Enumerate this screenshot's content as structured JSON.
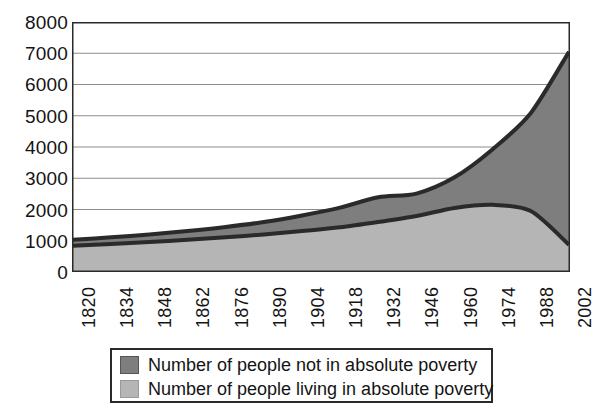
{
  "chart_data": {
    "type": "area",
    "title": "",
    "subtitle": "",
    "xlabel": "",
    "ylabel": "",
    "stacked": true,
    "grid": true,
    "legend_position": "bottom",
    "xlim": [
      1820,
      2002
    ],
    "ylim": [
      0,
      8000
    ],
    "x": [
      1820,
      1834,
      1848,
      1862,
      1876,
      1890,
      1904,
      1918,
      1932,
      1946,
      1960,
      1974,
      1988,
      2002
    ],
    "categories": [
      "1820",
      "1834",
      "1848",
      "1862",
      "1876",
      "1890",
      "1904",
      "1918",
      "1932",
      "1946",
      "1960",
      "1974",
      "1988",
      "2002"
    ],
    "ytick_labels": [
      "8000",
      "7000",
      "6000",
      "5000",
      "4000",
      "3000",
      "2000",
      "1000",
      "0"
    ],
    "ytick_values": [
      8000,
      7000,
      6000,
      5000,
      4000,
      3000,
      2000,
      1000,
      0
    ],
    "series": [
      {
        "name": "Number of people living in absolute poverty",
        "color": "#b5b5b5",
        "values": [
          840,
          900,
          960,
          1030,
          1110,
          1200,
          1310,
          1430,
          1600,
          1790,
          2050,
          2150,
          1950,
          870
        ]
      },
      {
        "name": "Number of people not in absolute poverty",
        "color": "#7e7e7e",
        "values": [
          190,
          210,
          240,
          280,
          330,
          400,
          500,
          630,
          790,
          720,
          980,
          1780,
          3140,
          6180
        ]
      }
    ],
    "stack_totals": [
      1030,
      1110,
      1200,
      1310,
      1440,
      1600,
      1810,
      2060,
      2390,
      2510,
      3030,
      3930,
      5090,
      7050
    ],
    "line_color": "#2a2a2a",
    "background": "#ffffff"
  },
  "legend": {
    "items": [
      {
        "label": "Number of people not in absolute poverty",
        "color": "#7e7e7e"
      },
      {
        "label": "Number of people living in absolute poverty",
        "color": "#b5b5b5"
      }
    ]
  }
}
